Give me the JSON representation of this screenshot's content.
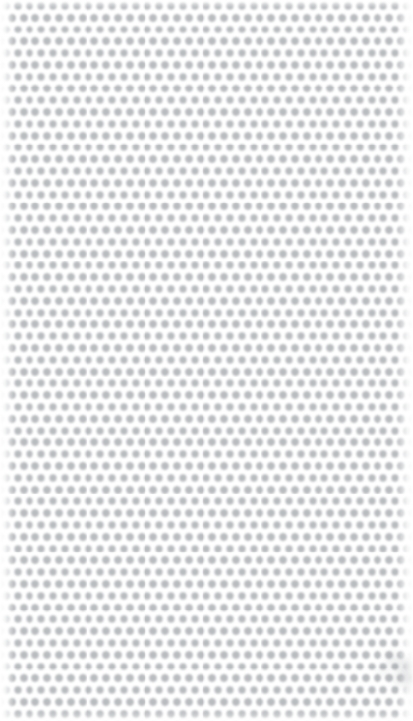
{
  "canvas": {
    "width": 413,
    "height": 721,
    "background_color": "#ffffff",
    "description": "Seamless staggered polka-dot texture"
  },
  "pattern": {
    "name": "staggered-polka-dots",
    "dot_color": "#b9bcbf",
    "background_color": "#ffffff",
    "dot_diameter_px": 7.2,
    "dot_radius_px": 3.6,
    "column_period_px": 11.8,
    "row_period_px": 11.8,
    "row_offset_px": 5.9,
    "row_offset_fraction": 0.5,
    "columns_visible": 35,
    "rows_visible": 61,
    "edge_softness_px": 0.9,
    "lattice": "hexagonal-staggered"
  },
  "vignette": {
    "name": "edge-fade",
    "left_width_px": 14,
    "right_width_px": 16,
    "top_height_px": 8,
    "bottom_height_px": 10,
    "color": "#ffffff"
  },
  "artifact": {
    "name": "corner-smudge",
    "location": "bottom-right",
    "x": 368,
    "y": 648,
    "width": 45,
    "height": 46,
    "color": "#8c9094",
    "opacity": 0.32,
    "blur_px": 3,
    "blobs": [
      {
        "left": 18,
        "top": 4,
        "w": 15,
        "h": 15,
        "color": "#9aa0a4",
        "opacity": 0.42
      },
      {
        "left": 30,
        "top": 10,
        "w": 14,
        "h": 16,
        "color": "#868c90",
        "opacity": 0.5
      },
      {
        "left": 24,
        "top": 22,
        "w": 16,
        "h": 16,
        "color": "#909599",
        "opacity": 0.38
      },
      {
        "left": 34,
        "top": 24,
        "w": 11,
        "h": 12,
        "color": "#6f7478",
        "opacity": 0.46
      },
      {
        "left": 8,
        "top": 16,
        "w": 14,
        "h": 14,
        "color": "#a3a8ac",
        "opacity": 0.26
      },
      {
        "left": 36,
        "top": 36,
        "w": 10,
        "h": 10,
        "color": "#9aa0a4",
        "opacity": 0.22
      }
    ]
  },
  "text": {
    "has_text": false,
    "labels": []
  }
}
